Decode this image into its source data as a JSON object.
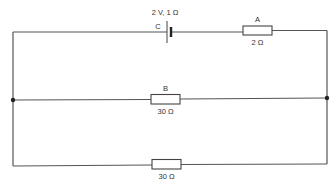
{
  "diagram": {
    "type": "circuit",
    "battery": {
      "id": "C",
      "label": "C",
      "rating": "2 V, 1 Ω"
    },
    "resistors": [
      {
        "id": "A",
        "label": "A",
        "value": "2 Ω",
        "branch": "top"
      },
      {
        "id": "B",
        "label": "B",
        "value": "30 Ω",
        "branch": "middle"
      },
      {
        "id": "unlabeled",
        "label": "",
        "value": "30 Ω",
        "branch": "bottom"
      }
    ],
    "junctions": [
      "left",
      "right"
    ],
    "colors": {
      "wire": "#555555",
      "background": "#ffffff"
    }
  }
}
